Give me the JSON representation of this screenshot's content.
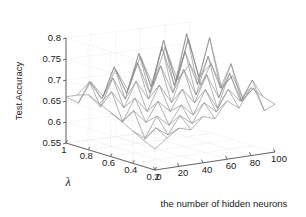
{
  "figure": {
    "background": "#ffffff",
    "mesh_color": "#8a8a8a",
    "grid_color": "#d8d8d8",
    "axis_color": "#555555",
    "text_color": "#1a1a1a"
  },
  "chart_data": {
    "type": "line",
    "plot_style": "3d-surface-mesh",
    "title": "",
    "xlabel": "the number of hidden neurons",
    "ylabel": "λ",
    "zlabel": "Test Accuracy",
    "xticks": [
      "0",
      "20",
      "40",
      "60",
      "80",
      "100"
    ],
    "xtick_values": [
      0,
      20,
      40,
      60,
      80,
      100
    ],
    "yticks": [
      "1",
      "0.8",
      "0.6",
      "0.4",
      "0.2"
    ],
    "ytick_values": [
      1,
      0.8,
      0.6,
      0.4,
      0.2
    ],
    "zticks": [
      "0.55",
      "0.6",
      "0.65",
      "0.7",
      "0.75",
      "0.8"
    ],
    "ztick_values": [
      0.55,
      0.6,
      0.65,
      0.7,
      0.75,
      0.8
    ],
    "xlim": [
      0,
      100
    ],
    "ylim": [
      0.2,
      1.0
    ],
    "zlim": [
      0.55,
      0.8
    ],
    "grid": true,
    "legend": null,
    "x": [
      0,
      10,
      20,
      30,
      40,
      50,
      60,
      70,
      80,
      90,
      100
    ],
    "y": [
      0.2,
      0.3,
      0.4,
      0.5,
      0.6,
      0.7,
      0.8,
      0.9,
      1.0
    ],
    "z_note": "Test accuracy surface Z[y_index][x_index]; rows are lambda 0.2..1.0, cols are hidden neurons 0..100",
    "z": [
      [
        0.6,
        0.622,
        0.641,
        0.633,
        0.66,
        0.651,
        0.689,
        0.667,
        0.712,
        0.686,
        0.664
      ],
      [
        0.612,
        0.638,
        0.617,
        0.659,
        0.636,
        0.681,
        0.655,
        0.705,
        0.672,
        0.718,
        0.641
      ],
      [
        0.627,
        0.605,
        0.654,
        0.628,
        0.672,
        0.644,
        0.7,
        0.652,
        0.731,
        0.66,
        0.688
      ],
      [
        0.641,
        0.663,
        0.631,
        0.677,
        0.649,
        0.698,
        0.661,
        0.724,
        0.665,
        0.742,
        0.653
      ],
      [
        0.655,
        0.629,
        0.681,
        0.645,
        0.704,
        0.658,
        0.733,
        0.668,
        0.756,
        0.677,
        0.702
      ],
      [
        0.668,
        0.692,
        0.65,
        0.709,
        0.663,
        0.738,
        0.67,
        0.764,
        0.681,
        0.789,
        0.664
      ],
      [
        0.681,
        0.648,
        0.713,
        0.659,
        0.742,
        0.666,
        0.771,
        0.675,
        0.795,
        0.688,
        0.716
      ],
      [
        0.672,
        0.7,
        0.655,
        0.728,
        0.661,
        0.752,
        0.668,
        0.776,
        0.672,
        0.772,
        0.658
      ],
      [
        0.66,
        0.641,
        0.688,
        0.65,
        0.71,
        0.657,
        0.733,
        0.662,
        0.748,
        0.666,
        0.7
      ]
    ]
  }
}
